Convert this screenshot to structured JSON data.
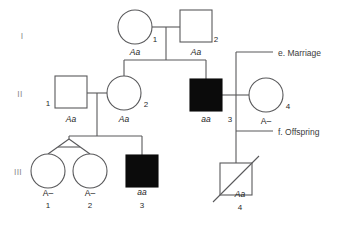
{
  "figure": {
    "type": "pedigree-chart",
    "background_color": "#ffffff",
    "line_color": "#59595b",
    "filled_color": "#0b0b0b",
    "generation_labels": [
      {
        "id": "gen-I",
        "text": "I",
        "x": 22,
        "y": 39
      },
      {
        "id": "gen-II",
        "text": "II",
        "x": 20,
        "y": 97
      },
      {
        "id": "gen-III",
        "text": "III",
        "x": 18,
        "y": 175
      }
    ],
    "individuals": [
      {
        "id": "I-1",
        "shape": "circle",
        "sex": "female",
        "affected": false,
        "deceased": false,
        "cx": 135,
        "cy": 27,
        "r": 17,
        "number": "1",
        "number_x": 155,
        "number_y": 42,
        "genotype": "Aa",
        "genotype_x": 135,
        "genotype_y": 55
      },
      {
        "id": "I-2",
        "shape": "square",
        "sex": "male",
        "affected": false,
        "deceased": false,
        "x": 180,
        "y": 10,
        "size": 32,
        "number": "2",
        "number_x": 215,
        "number_y": 42,
        "genotype": "Aa",
        "genotype_x": 196,
        "genotype_y": 55
      },
      {
        "id": "II-1",
        "shape": "square",
        "sex": "male",
        "affected": false,
        "deceased": false,
        "x": 55,
        "y": 76,
        "size": 32,
        "number": "1",
        "number_x": 48,
        "number_y": 105,
        "genotype": "Aa",
        "genotype_x": 71,
        "genotype_y": 121
      },
      {
        "id": "II-2",
        "shape": "circle",
        "sex": "female",
        "affected": false,
        "deceased": false,
        "cx": 124,
        "cy": 93,
        "r": 17,
        "number": "2",
        "number_x": 145,
        "number_y": 107,
        "genotype": "Aa",
        "genotype_x": 124,
        "genotype_y": 121
      },
      {
        "id": "II-3",
        "shape": "square",
        "sex": "male",
        "affected": true,
        "deceased": false,
        "x": 190,
        "y": 79,
        "size": 32,
        "number": "3",
        "number_x": 229,
        "number_y": 121,
        "genotype": "aa",
        "genotype_x": 206,
        "genotype_y": 121
      },
      {
        "id": "II-4",
        "shape": "circle",
        "sex": "female",
        "affected": false,
        "deceased": false,
        "cx": 266,
        "cy": 95,
        "r": 17,
        "number": "4",
        "number_x": 287,
        "number_y": 109,
        "genotype": "A–",
        "genotype_x": 266,
        "genotype_y": 123
      },
      {
        "id": "III-1",
        "shape": "circle",
        "sex": "female",
        "affected": false,
        "deceased": false,
        "cx": 48,
        "cy": 171,
        "r": 17,
        "number": "1",
        "number_x": 48,
        "number_y": 207,
        "genotype": "A–",
        "genotype_x": 48,
        "genotype_y": 195
      },
      {
        "id": "III-2",
        "shape": "circle",
        "sex": "female",
        "affected": false,
        "deceased": false,
        "cx": 90,
        "cy": 171,
        "r": 17,
        "number": "2",
        "number_x": 90,
        "number_y": 207,
        "genotype": "A–",
        "genotype_x": 90,
        "genotype_y": 195
      },
      {
        "id": "III-3",
        "shape": "square",
        "sex": "male",
        "affected": true,
        "deceased": false,
        "x": 126,
        "y": 155,
        "size": 32,
        "number": "3",
        "number_x": 142,
        "number_y": 207,
        "genotype": "aa",
        "genotype_x": 142,
        "genotype_y": 194
      },
      {
        "id": "III-4",
        "shape": "square",
        "sex": "male",
        "affected": false,
        "deceased": true,
        "x": 220,
        "y": 163,
        "size": 32,
        "number": "4",
        "number_x": 240,
        "number_y": 209,
        "genotype": "Aa",
        "genotype_x": 240,
        "genotype_y": 196
      }
    ],
    "annotations": [
      {
        "id": "annot-marriage",
        "text": "e. Marriage",
        "text_x": 278,
        "text_y": 56,
        "leader_x1": 236,
        "leader_y1": 52,
        "leader_x2": 273,
        "leader_y2": 52
      },
      {
        "id": "annot-offspring",
        "text": "f. Offspring",
        "text_x": 278,
        "text_y": 135,
        "leader_x1": 236,
        "leader_y1": 131,
        "leader_x2": 273,
        "leader_y2": 131
      }
    ]
  }
}
